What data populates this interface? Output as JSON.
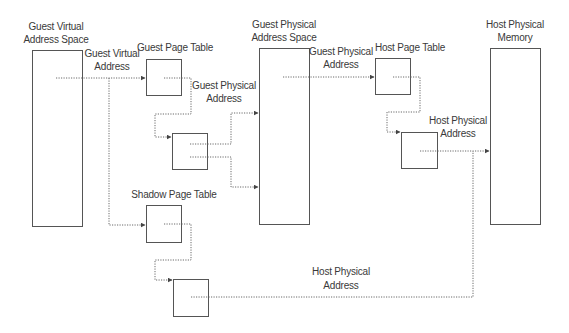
{
  "diagram": {
    "colors": {
      "box_stroke": "#555555",
      "arrow_stroke": "#6a6a6a",
      "text": "#3a3a3a",
      "background": "#ffffff"
    },
    "columns": [
      {
        "id": "guest-virtual-space",
        "label_line1": "Guest Virtual",
        "label_line2": "Address Space"
      },
      {
        "id": "guest-physical-space",
        "label_line1": "Guest Physical",
        "label_line2": "Address Space"
      },
      {
        "id": "host-physical-memory",
        "label_line1": "Host Physical",
        "label_line2": "Memory"
      }
    ],
    "tables": {
      "guest_page_table": "Guest Page Table",
      "shadow_page_table": "Shadow Page Table",
      "host_page_table": "Host Page Table"
    },
    "edge_labels": {
      "guest_virtual_address": {
        "line1": "Guest Virtual",
        "line2": "Address"
      },
      "guest_physical_address_1": {
        "line1": "Guest Physical",
        "line2": "Address"
      },
      "guest_physical_address_2": {
        "line1": "Guest Physical",
        "line2": "Address"
      },
      "host_physical_address_1": {
        "line1": "Host Physical",
        "line2": "Address"
      },
      "host_physical_address_2": {
        "line1": "Host Physical",
        "line2": "Address"
      }
    }
  }
}
